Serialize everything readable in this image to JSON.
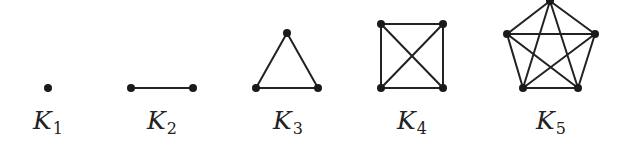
{
  "figure": {
    "colors": {
      "edge": "#222222",
      "vertex": "#1a1a1a",
      "background": "#ffffff"
    }
  },
  "graphs": [
    {
      "name": "K",
      "subscript": "1",
      "label_pos": [
        48,
        108
      ],
      "vertices": [
        [
          48,
          88
        ]
      ],
      "edges": []
    },
    {
      "name": "K",
      "subscript": "2",
      "label_pos": [
        162,
        108
      ],
      "vertices": [
        [
          131,
          88
        ],
        [
          193,
          88
        ]
      ],
      "edges": [
        [
          0,
          1
        ]
      ]
    },
    {
      "name": "K",
      "subscript": "3",
      "label_pos": [
        288,
        108
      ],
      "vertices": [
        [
          287,
          33
        ],
        [
          256,
          88
        ],
        [
          318,
          88
        ]
      ],
      "edges": [
        [
          0,
          1
        ],
        [
          0,
          2
        ],
        [
          1,
          2
        ]
      ]
    },
    {
      "name": "K",
      "subscript": "4",
      "label_pos": [
        412,
        108
      ],
      "vertices": [
        [
          381,
          24
        ],
        [
          443,
          24
        ],
        [
          381,
          88
        ],
        [
          443,
          88
        ]
      ],
      "edges": [
        [
          0,
          1
        ],
        [
          0,
          2
        ],
        [
          0,
          3
        ],
        [
          1,
          2
        ],
        [
          1,
          3
        ],
        [
          2,
          3
        ]
      ]
    },
    {
      "name": "K",
      "subscript": "5",
      "label_pos": [
        551,
        108
      ],
      "vertices": [
        [
          550,
          1
        ],
        [
          507,
          34
        ],
        [
          595,
          34
        ],
        [
          523,
          88
        ],
        [
          578,
          88
        ]
      ],
      "edges": [
        [
          0,
          1
        ],
        [
          0,
          2
        ],
        [
          0,
          3
        ],
        [
          0,
          4
        ],
        [
          1,
          2
        ],
        [
          1,
          3
        ],
        [
          1,
          4
        ],
        [
          2,
          3
        ],
        [
          2,
          4
        ],
        [
          3,
          4
        ]
      ]
    }
  ]
}
